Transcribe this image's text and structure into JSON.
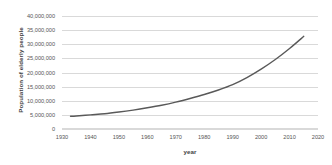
{
  "chart_data": {
    "type": "line",
    "title": "",
    "xlabel": "year",
    "ylabel": "Population of elderly people",
    "xlim": [
      1930,
      2020
    ],
    "ylim": [
      0,
      40000000
    ],
    "grid": true,
    "legend": false,
    "legend_position": "none",
    "line_color": "#595959",
    "xticks": [
      1930,
      1940,
      1950,
      1960,
      1970,
      1980,
      1990,
      2000,
      2010,
      2020
    ],
    "xtick_labels": [
      "1930",
      "1940",
      "1950",
      "1960",
      "1970",
      "1980",
      "1990",
      "2000",
      "2010",
      "2020"
    ],
    "yticks": [
      0,
      5000000,
      10000000,
      15000000,
      20000000,
      25000000,
      30000000,
      35000000,
      40000000
    ],
    "ytick_labels": [
      "0",
      "5,000,000",
      "10,000,000",
      "15,000,000",
      "20,000,000",
      "25,000,000",
      "30,000,000",
      "35,000,000",
      "40,000,000"
    ],
    "series": [
      {
        "name": "Population of elderly people",
        "x": [
          1933,
          1935,
          1940,
          1945,
          1950,
          1955,
          1960,
          1965,
          1970,
          1975,
          1980,
          1985,
          1990,
          1995,
          2000,
          2005,
          2010,
          2015
        ],
        "values": [
          4500000,
          4600000,
          5000000,
          5400000,
          6000000,
          6700000,
          7500000,
          8400000,
          9500000,
          10800000,
          12200000,
          13800000,
          15700000,
          18200000,
          21200000,
          24600000,
          28500000,
          32800000
        ]
      }
    ]
  },
  "axes": {
    "y_title": "Population of elderly people",
    "x_title": "year"
  }
}
